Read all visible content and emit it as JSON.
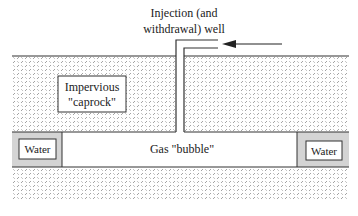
{
  "diagram": {
    "title_line1": "Injection (and",
    "title_line2": "withdrawal) well",
    "caprock_line1": "Impervious",
    "caprock_line2": "\"caprock\"",
    "gas_label": "Gas \"bubble\"",
    "water_left_label": "Water",
    "water_right_label": "Water",
    "colors": {
      "line": "#333333",
      "hatch": "#8a8a8a",
      "water_fill": "#d4d4d4",
      "gas_fill": "#ffffff",
      "background": "#ffffff"
    },
    "arrow_direction": "left"
  }
}
